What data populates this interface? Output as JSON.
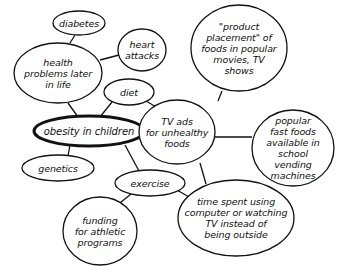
{
  "diagram": {
    "colors": {
      "stroke": "#111111",
      "background": "#ffffff",
      "text": "#111111"
    },
    "nodes": {
      "diabetes": {
        "label": "diabetes"
      },
      "heart_attacks": {
        "label": "heart\nattacks"
      },
      "health_problems": {
        "label": "health\nproblems later\nin life"
      },
      "diet": {
        "label": "diet"
      },
      "obesity": {
        "label": "obesity in children"
      },
      "genetics": {
        "label": "genetics"
      },
      "exercise": {
        "label": "exercise"
      },
      "funding": {
        "label": "funding\nfor athletic\nprograms"
      },
      "product_placement": {
        "label": "\"product\nplacement\" of\nfoods in popular\nmovies, TV\nshows"
      },
      "tv_ads": {
        "label": "TV ads\nfor unhealthy\nfoods"
      },
      "fast_foods": {
        "label": "popular\nfast foods\navailable in\nschool vending\nmachines"
      },
      "time_spent": {
        "label": "time spent using\ncomputer or watching\nTV instead of\nbeing outside"
      }
    },
    "edges": [
      [
        "diabetes",
        "health_problems"
      ],
      [
        "heart_attacks",
        "health_problems"
      ],
      [
        "health_problems",
        "obesity"
      ],
      [
        "diet",
        "obesity"
      ],
      [
        "diet",
        "tv_ads"
      ],
      [
        "obesity",
        "genetics"
      ],
      [
        "obesity",
        "exercise"
      ],
      [
        "exercise",
        "funding"
      ],
      [
        "exercise",
        "time_spent"
      ],
      [
        "tv_ads",
        "product_placement"
      ],
      [
        "tv_ads",
        "fast_foods"
      ],
      [
        "tv_ads",
        "time_spent"
      ]
    ]
  }
}
